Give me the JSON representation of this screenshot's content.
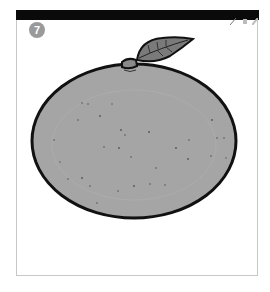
{
  "badge": {
    "number": "7"
  },
  "toolbar": {
    "icons": [
      "pencil-icon",
      "eraser-icon",
      "brush-icon"
    ]
  },
  "illustration": {
    "subject": "orange-fruit",
    "fill_color": "#a5a5a5",
    "outline_color": "#111111",
    "leaf_color": "#7a7a7a"
  }
}
